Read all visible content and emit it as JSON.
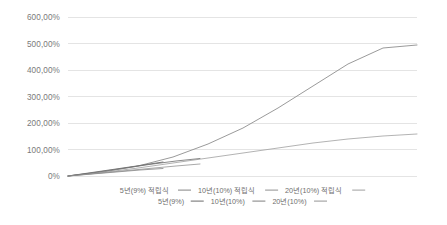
{
  "chart_data": {
    "type": "line",
    "title": "",
    "xlabel": "",
    "ylabel": "",
    "ylim": [
      0,
      600
    ],
    "ytick_labels": [
      "600,00%",
      "500,00%",
      "400,00%",
      "300,00%",
      "200,00%",
      "100,00%",
      "0%"
    ],
    "ytick_values": [
      600,
      500,
      400,
      300,
      200,
      100,
      0
    ],
    "grid": true,
    "legend_position": "bottom",
    "x_range": [
      0,
      20
    ],
    "x_unit": "years",
    "series": [
      {
        "name": "5년(9%) 적립식",
        "color": "#8c8c8c",
        "x": [
          0,
          1,
          2,
          3,
          4,
          5
        ],
        "values": [
          0,
          9.5,
          19.8,
          31.0,
          43.2,
          56.4
        ]
      },
      {
        "name": "10년(10%) 적립식",
        "color": "#9a9a9a",
        "x": [
          0,
          1,
          2,
          3,
          4,
          5,
          6,
          7,
          8,
          9,
          10
        ],
        "values": [
          0,
          10.0,
          21.0,
          33.1,
          46.4,
          61.1,
          77.2,
          94.9,
          114.4,
          135.8,
          159.4
        ]
      },
      {
        "name": "20년(10%) 적립식",
        "color": "#a8a8a8",
        "x": [
          0,
          2,
          4,
          6,
          8,
          10,
          12,
          14,
          16,
          18,
          20
        ],
        "values": [
          0,
          21.0,
          46.4,
          77.2,
          114.4,
          159.4,
          213.8,
          279.7,
          359.4,
          455.9,
          572.7
        ]
      },
      {
        "name": "5년(9%)",
        "color": "#787878",
        "x": [
          0,
          1,
          2,
          3,
          4,
          5
        ],
        "values": [
          0,
          9.0,
          18.8,
          29.5,
          41.2,
          53.9
        ]
      },
      {
        "name": "10년(10%)",
        "color": "#8a8a8a",
        "x": [
          0,
          1,
          2,
          3,
          4,
          5,
          6,
          7,
          8,
          9,
          10
        ],
        "values": [
          0,
          10.0,
          21.0,
          33.1,
          46.4,
          61.1,
          77.2,
          94.9,
          114.4,
          135.8,
          159.4
        ]
      },
      {
        "name": "20년(10%)",
        "color": "#9e9e9e",
        "x": [
          0,
          2,
          4,
          6,
          8,
          10,
          12,
          14,
          16,
          18,
          20
        ],
        "values": [
          0,
          21.0,
          46.4,
          77.2,
          114.4,
          159.4,
          213.8,
          279.7,
          359.4,
          455.9,
          572.7
        ]
      }
    ],
    "rendered_curves": [
      {
        "name": "20년(10%) 적립식",
        "color": "#8f8f8f",
        "width": 0.9,
        "points": [
          [
            68,
            176
          ],
          [
            103,
            172
          ],
          [
            138,
            166
          ],
          [
            173,
            157
          ],
          [
            208,
            144
          ],
          [
            243,
            128
          ],
          [
            278,
            108
          ],
          [
            313,
            86
          ],
          [
            348,
            64
          ],
          [
            383,
            48
          ],
          [
            417,
            45
          ]
        ]
      },
      {
        "name": "20년(10%)",
        "color": "#a5a5a5",
        "width": 0.85,
        "points": [
          [
            68,
            176
          ],
          [
            103,
            172.5
          ],
          [
            138,
            168
          ],
          [
            173,
            163
          ],
          [
            208,
            158
          ],
          [
            243,
            153
          ],
          [
            278,
            148
          ],
          [
            313,
            143
          ],
          [
            348,
            139
          ],
          [
            383,
            136
          ],
          [
            417,
            134
          ]
        ]
      },
      {
        "name": "10년(10%) 적립식",
        "color": "#7d7d7d",
        "width": 0.9,
        "points": [
          [
            68,
            176
          ],
          [
            95,
            172.5
          ],
          [
            122,
            168.5
          ],
          [
            149,
            164.5
          ],
          [
            176,
            161
          ],
          [
            200,
            158.5
          ]
        ]
      },
      {
        "name": "10년(10%)",
        "color": "#999999",
        "width": 0.85,
        "points": [
          [
            68,
            176
          ],
          [
            95,
            173.5
          ],
          [
            122,
            171
          ],
          [
            149,
            168.5
          ],
          [
            176,
            166
          ],
          [
            200,
            164
          ]
        ]
      },
      {
        "name": "5년(9%) 적립식",
        "color": "#6f6f6f",
        "width": 0.9,
        "points": [
          [
            68,
            176
          ],
          [
            92,
            172.5
          ],
          [
            116,
            169
          ],
          [
            140,
            165.5
          ],
          [
            163,
            162
          ]
        ]
      },
      {
        "name": "5년(9%)",
        "color": "#8c8c8c",
        "width": 0.85,
        "points": [
          [
            68,
            176
          ],
          [
            92,
            174
          ],
          [
            116,
            172
          ],
          [
            140,
            170
          ],
          [
            163,
            168.5
          ]
        ]
      }
    ]
  },
  "axis": {
    "ytick_labels": [
      "600,00%",
      "500,00%",
      "400,00%",
      "300,00%",
      "200,00%",
      "100,00%",
      "0%"
    ]
  },
  "legend": {
    "rows": [
      {
        "items": [
          {
            "label": "5년(9%) 적립식",
            "color": "#8f8f8f"
          },
          {
            "label": "10년(10%) 적립식",
            "color": "#9a9a9a"
          },
          {
            "label": "20년(10%) 적립식",
            "color": "#a8a8a8"
          }
        ]
      },
      {
        "items": [
          {
            "label": "5년(9%)",
            "color": "#787878"
          },
          {
            "label": "10년(10%)",
            "color": "#8a8a8a"
          },
          {
            "label": "20년(10%)",
            "color": "#9e9e9e"
          }
        ]
      }
    ]
  },
  "colors": {
    "background": "#ffffff",
    "grid": "#d9d9d9",
    "text": "#7a7a7a"
  }
}
